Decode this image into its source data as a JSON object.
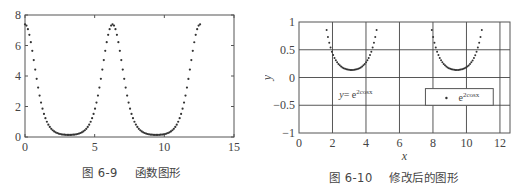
{
  "chart_data": [
    {
      "type": "scatter",
      "title": "",
      "caption": "图 6-9    函数图形",
      "function": "y = e^(2cos x)",
      "xlabel": "",
      "ylabel": "",
      "xlim": [
        0,
        15
      ],
      "ylim": [
        0,
        8
      ],
      "xticks": [
        0,
        5,
        10,
        15
      ],
      "yticks": [
        0,
        2,
        4,
        6,
        8
      ],
      "grid": false,
      "legend": null,
      "x_domain": [
        0,
        12.566
      ],
      "marker": "dot",
      "series": [
        {
          "name": "e^(2cos x)",
          "x": [
            0,
            0.79,
            1.57,
            2.36,
            3.14,
            3.93,
            4.71,
            5.5,
            6.28,
            7.07,
            7.85,
            8.64,
            9.42,
            10.21,
            11.0,
            11.78,
            12.57
          ],
          "values": [
            7.39,
            4.11,
            1.0,
            0.24,
            0.14,
            0.24,
            1.0,
            4.11,
            7.39,
            4.11,
            1.0,
            0.24,
            0.14,
            0.24,
            1.0,
            4.11,
            7.39
          ]
        }
      ]
    },
    {
      "type": "scatter",
      "title": "",
      "caption": "图 6-10    修改后的图形",
      "function": "y = e^(2cos x)",
      "xlabel": "x",
      "ylabel": "y",
      "xlim": [
        0,
        12.6
      ],
      "ylim": [
        -1,
        1
      ],
      "xticks": [
        0,
        2,
        4,
        6,
        8,
        10,
        12
      ],
      "yticks": [
        -1,
        -0.5,
        0,
        0.5,
        1
      ],
      "ytick_labels": [
        "−1",
        "−0.5",
        "0",
        "0.5",
        "1"
      ],
      "grid": true,
      "annotation": {
        "text": "y= e",
        "sup": "2cosx",
        "x": 2.0,
        "y": -0.3
      },
      "legend": {
        "entries": [
          {
            "marker": "dot",
            "label": "e",
            "sup": "2cosx"
          }
        ],
        "position": "inside right, y≈-0.3"
      },
      "marker": "dot",
      "series": [
        {
          "name": "e^(2cos x)",
          "x": [
            1.65,
            2.0,
            2.5,
            3.14,
            3.8,
            4.3,
            4.75,
            7.95,
            8.3,
            8.8,
            9.42,
            10.0,
            10.5,
            10.95
          ],
          "values": [
            0.95,
            0.44,
            0.2,
            0.14,
            0.2,
            0.44,
            0.95,
            0.9,
            0.44,
            0.2,
            0.14,
            0.2,
            0.44,
            0.82
          ]
        }
      ]
    }
  ],
  "left": {
    "caption": "图 6-9    函数图形",
    "ytick_labels": [
      "0",
      "2",
      "4",
      "6",
      "8"
    ],
    "xtick_labels": [
      "0",
      "5",
      "10",
      "15"
    ]
  },
  "right": {
    "caption": "图 6-10    修改后的图形",
    "xlabel": "x",
    "ylabel": "y",
    "ytick_labels": [
      "−1",
      "−0.5",
      "0",
      "0.5",
      "1"
    ],
    "xtick_labels": [
      "0",
      "2",
      "4",
      "6",
      "8",
      "10",
      "12"
    ],
    "annotation_prefix": "y= e",
    "annotation_sup": "2cosx",
    "legend_label": "e",
    "legend_sup": "2cosx"
  },
  "colors": {
    "axes": "#555555",
    "grid": "#444444",
    "marker": "#333333",
    "text": "#444444"
  }
}
